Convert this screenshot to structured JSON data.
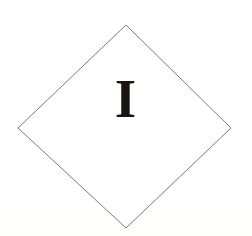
{
  "placard": {
    "name": "hazard-division-placard",
    "shape": "diamond",
    "symbol": "I",
    "symbol_description": "roman-numeral-one",
    "background_color": "#ffffff",
    "outline_color": "#7a7a7a",
    "symbol_color": "#1a1410",
    "outline_width_px": 1,
    "canvas": {
      "width": 252,
      "height": 236
    },
    "vertices": {
      "top": [
        126,
        25
      ],
      "right": [
        231,
        128
      ],
      "bottom": [
        126,
        228
      ],
      "left": [
        18,
        128
      ]
    },
    "symbol_box": {
      "x": 113,
      "y": 79,
      "width": 25,
      "height": 41
    }
  }
}
